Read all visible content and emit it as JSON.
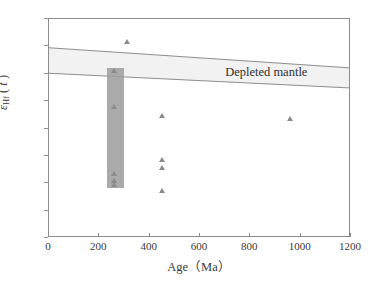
{
  "figure": {
    "background": "#ffffff",
    "frame_color": "#8c8c8c"
  },
  "chart_data": {
    "type": "scatter",
    "title": "",
    "xlabel": "Age（Ma）",
    "ylabel_parts": {
      "symbol": "ε",
      "subscript": "Hf",
      "paren_open": "(",
      "variable": "t",
      "paren_close": ")"
    },
    "ylabel": "εHf(t)",
    "xlim": [
      0,
      1200
    ],
    "ylim": [
      -20,
      20
    ],
    "xticks": [
      0,
      200,
      400,
      600,
      800,
      1000,
      1200
    ],
    "yticks": [
      -20,
      -15,
      -10,
      -5,
      0,
      5,
      10,
      15,
      20
    ],
    "xtick_labels": [
      "0",
      "200",
      "400",
      "600",
      "800",
      "1000",
      "1200"
    ],
    "ytick_labels": [
      "-20",
      "-15",
      "-10",
      "-5",
      "0",
      "5",
      "10",
      "15",
      "20"
    ],
    "grid": false,
    "legend": null,
    "marker": {
      "shape": "triangle-up",
      "color": "#8a8a8a",
      "size": 6
    },
    "points": [
      {
        "x": 310,
        "y": 15.8
      },
      {
        "x": 258,
        "y": 10.5
      },
      {
        "x": 259,
        "y": 4.0
      },
      {
        "x": 258,
        "y": -8.3
      },
      {
        "x": 258,
        "y": -9.5
      },
      {
        "x": 259,
        "y": -10.3
      },
      {
        "x": 450,
        "y": 2.4
      },
      {
        "x": 448,
        "y": -5.7
      },
      {
        "x": 448,
        "y": -7.2
      },
      {
        "x": 450,
        "y": -11.4
      },
      {
        "x": 960,
        "y": 1.8
      }
    ],
    "shaded_box": {
      "label": "shaded-age-range-box",
      "x_range": [
        230,
        300
      ],
      "y_range": [
        -10.8,
        11.0
      ],
      "color": "#9e9e9e"
    },
    "band": {
      "label": "Depleted mantle",
      "color": "#f2f2f2",
      "edge_color": "#8c8c8c",
      "upper_left": 14.7,
      "upper_right": 11.0,
      "lower_left": 10.0,
      "lower_right": 7.3,
      "annotation_x": 700,
      "annotation_y": 10.2
    }
  }
}
